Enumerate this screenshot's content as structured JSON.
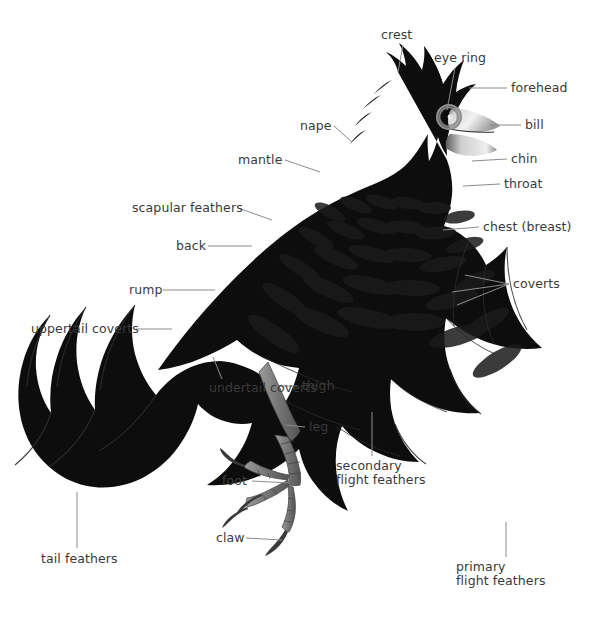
{
  "figure": {
    "background_color": "#ffffff",
    "body_color": "#0d0d0d",
    "leader_line_color": "#8c8c8c",
    "label_text_color": "#3a3a3a",
    "leg_color": "#7d7d7d",
    "bill_color": "#c9c9c9",
    "eye_ring_color": "#8f8f8f"
  },
  "labels": [
    {
      "id": "crest",
      "text": "crest",
      "x": 381,
      "y": 28,
      "align": "left",
      "anchor_x": 403,
      "anchor_y": 45,
      "tip_x": 398,
      "tip_y": 72
    },
    {
      "id": "eye-ring",
      "text": "eye ring",
      "x": 434,
      "y": 51,
      "align": "left",
      "anchor_x": 455,
      "anchor_y": 68,
      "tip_x": 447,
      "tip_y": 110
    },
    {
      "id": "forehead",
      "text": "forehead",
      "x": 511,
      "y": 81,
      "align": "left",
      "anchor_x": 507,
      "anchor_y": 88,
      "tip_x": 469,
      "tip_y": 88
    },
    {
      "id": "bill",
      "text": "bill",
      "x": 525,
      "y": 118,
      "align": "left",
      "anchor_x": 521,
      "anchor_y": 125,
      "tip_x": 490,
      "tip_y": 125
    },
    {
      "id": "chin",
      "text": "chin",
      "x": 511,
      "y": 152,
      "align": "left",
      "anchor_x": 507,
      "anchor_y": 159,
      "tip_x": 472,
      "tip_y": 161
    },
    {
      "id": "throat",
      "text": "throat",
      "x": 504,
      "y": 177,
      "align": "left",
      "anchor_x": 500,
      "anchor_y": 184,
      "tip_x": 463,
      "tip_y": 186
    },
    {
      "id": "chest-breast",
      "text": "chest (breast)",
      "x": 483,
      "y": 220,
      "align": "left",
      "anchor_x": 479,
      "anchor_y": 227,
      "tip_x": 443,
      "tip_y": 230
    },
    {
      "id": "coverts",
      "text": "coverts",
      "x": 513,
      "y": 277,
      "align": "left",
      "anchor_x": 509,
      "anchor_y": 284,
      "tip_x": 465,
      "tip_y": 275
    },
    {
      "id": "nape",
      "text": "nape",
      "x": 300,
      "y": 119,
      "align": "left",
      "anchor_x": 334,
      "anchor_y": 126,
      "tip_x": 352,
      "tip_y": 142
    },
    {
      "id": "mantle",
      "text": "mantle",
      "x": 238,
      "y": 153,
      "align": "left",
      "anchor_x": 285,
      "anchor_y": 160,
      "tip_x": 320,
      "tip_y": 172
    },
    {
      "id": "scapular-feathers",
      "text": "scapular feathers",
      "x": 132,
      "y": 201,
      "align": "left",
      "anchor_x": 238,
      "anchor_y": 208,
      "tip_x": 272,
      "tip_y": 220
    },
    {
      "id": "back",
      "text": "back",
      "x": 176,
      "y": 239,
      "align": "left",
      "anchor_x": 208,
      "anchor_y": 246,
      "tip_x": 252,
      "tip_y": 246
    },
    {
      "id": "rump",
      "text": "rump",
      "x": 129,
      "y": 283,
      "align": "left",
      "anchor_x": 163,
      "anchor_y": 290,
      "tip_x": 215,
      "tip_y": 290
    },
    {
      "id": "uppertail-coverts",
      "text": "uppertail coverts",
      "x": 31,
      "y": 322,
      "align": "left",
      "anchor_x": 136,
      "anchor_y": 329,
      "tip_x": 172,
      "tip_y": 329
    },
    {
      "id": "undertail-coverts",
      "text": "undertail coverts",
      "x": 209,
      "y": 381,
      "align": "left",
      "anchor_x": 222,
      "anchor_y": 379,
      "tip_x": 213,
      "tip_y": 357
    },
    {
      "id": "thigh",
      "text": "thigh",
      "x": 302,
      "y": 379,
      "align": "left",
      "anchor_x": 298,
      "anchor_y": 386,
      "tip_x": 277,
      "tip_y": 386
    },
    {
      "id": "leg",
      "text": "leg",
      "x": 309,
      "y": 420,
      "align": "left",
      "anchor_x": 305,
      "anchor_y": 427,
      "tip_x": 286,
      "tip_y": 425
    },
    {
      "id": "foot",
      "text": "foot",
      "x": 222,
      "y": 474,
      "align": "left",
      "anchor_x": 252,
      "anchor_y": 481,
      "tip_x": 290,
      "tip_y": 483
    },
    {
      "id": "claw",
      "text": "claw",
      "x": 216,
      "y": 531,
      "align": "left",
      "anchor_x": 246,
      "anchor_y": 538,
      "tip_x": 282,
      "tip_y": 540
    },
    {
      "id": "tail-feathers",
      "text": "tail feathers",
      "x": 41,
      "y": 552,
      "align": "left",
      "anchor_x": 77,
      "anchor_y": 548,
      "tip_x": 77,
      "tip_y": 492
    },
    {
      "id": "secondary-flight-feathers",
      "text": "secondary\nflight feathers",
      "x": 336,
      "y": 459,
      "align": "left",
      "anchor_x": 372,
      "anchor_y": 456,
      "tip_x": 372,
      "tip_y": 412
    },
    {
      "id": "primary-flight-feathers",
      "text": "primary\nflight feathers",
      "x": 456,
      "y": 560,
      "align": "left",
      "anchor_x": 506,
      "anchor_y": 557,
      "tip_x": 506,
      "tip_y": 522
    }
  ]
}
